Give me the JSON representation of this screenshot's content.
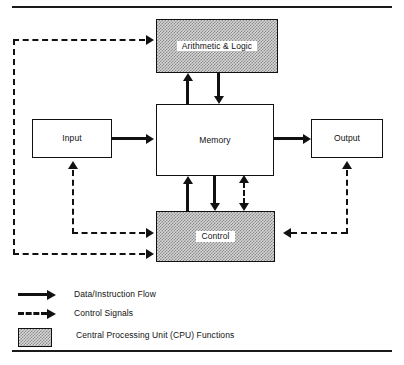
{
  "figure": {
    "colors": {
      "line": "#111111",
      "cpu_fill": "#d6d6d6",
      "cpu_stipple": "#8a8a8a",
      "box_fill": "#ffffff"
    }
  },
  "blocks": {
    "alu": {
      "label": "Arithmetic & Logic",
      "cpu": true
    },
    "memory": {
      "label": "Memory",
      "cpu": false
    },
    "input": {
      "label": "Input",
      "cpu": false
    },
    "output": {
      "label": "Output",
      "cpu": false
    },
    "control": {
      "label": "Control",
      "cpu": true
    }
  },
  "legend": {
    "items": [
      {
        "key": "solid-arrow",
        "label": "Data/Instruction Flow"
      },
      {
        "key": "dashed-arrow",
        "label": "Control Signals"
      },
      {
        "key": "stipple-swatch",
        "label": "Central Processing Unit (CPU) Functions"
      }
    ]
  },
  "connections": {
    "data_flow": [
      {
        "from": "input",
        "to": "memory",
        "style": "solid"
      },
      {
        "from": "memory",
        "to": "output",
        "style": "solid"
      },
      {
        "from": "memory",
        "to": "alu",
        "style": "solid"
      },
      {
        "from": "alu",
        "to": "memory",
        "style": "solid"
      },
      {
        "from": "memory",
        "to": "control",
        "style": "solid"
      },
      {
        "from": "control",
        "to": "memory",
        "style": "solid"
      }
    ],
    "control_signals": [
      {
        "from": "control",
        "to": "alu",
        "style": "dashed"
      },
      {
        "from": "control",
        "to": "input",
        "style": "dashed"
      },
      {
        "from": "control",
        "to": "output",
        "style": "dashed"
      },
      {
        "from": "control",
        "to": "memory",
        "style": "dashed-bidirectional"
      }
    ]
  }
}
